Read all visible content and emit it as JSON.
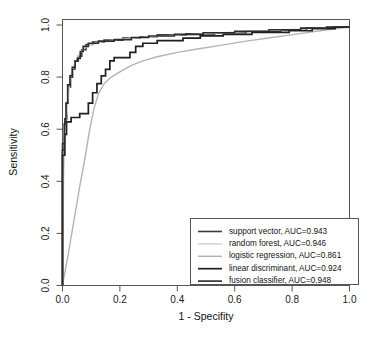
{
  "chart_data": {
    "type": "line",
    "title": "",
    "xlabel": "1 - Specifity",
    "ylabel": "Sensitivity",
    "xlim": [
      0,
      1
    ],
    "ylim": [
      0,
      1
    ],
    "grid": false,
    "legend_position": "bottom-right",
    "xticks": [
      "0.0",
      "0.2",
      "0.4",
      "0.6",
      "0.8",
      "1.0"
    ],
    "xtick_values": [
      0.0,
      0.2,
      0.4,
      0.6,
      0.8,
      1.0
    ],
    "yticks": [
      "0.0",
      "0.2",
      "0.4",
      "0.6",
      "0.8",
      "1.0"
    ],
    "ytick_values": [
      0.0,
      0.2,
      0.4,
      0.6,
      0.8,
      1.0
    ],
    "series": [
      {
        "name": "support vector",
        "auc": 0.943,
        "legend_label": "support vector,  AUC=0.943",
        "color": "#3a3a3a",
        "width": 1.6,
        "points": [
          [
            0.0,
            0.0
          ],
          [
            0.0,
            0.545
          ],
          [
            0.008,
            0.545
          ],
          [
            0.008,
            0.64
          ],
          [
            0.016,
            0.64
          ],
          [
            0.016,
            0.7
          ],
          [
            0.02,
            0.7
          ],
          [
            0.02,
            0.762
          ],
          [
            0.028,
            0.762
          ],
          [
            0.028,
            0.8
          ],
          [
            0.035,
            0.8
          ],
          [
            0.035,
            0.83
          ],
          [
            0.043,
            0.83
          ],
          [
            0.043,
            0.862
          ],
          [
            0.055,
            0.862
          ],
          [
            0.055,
            0.88
          ],
          [
            0.067,
            0.88
          ],
          [
            0.067,
            0.905
          ],
          [
            0.082,
            0.905
          ],
          [
            0.082,
            0.925
          ],
          [
            0.105,
            0.925
          ],
          [
            0.105,
            0.935
          ],
          [
            0.145,
            0.935
          ],
          [
            0.145,
            0.942
          ],
          [
            0.21,
            0.942
          ],
          [
            0.21,
            0.95
          ],
          [
            0.27,
            0.95
          ],
          [
            0.27,
            0.955
          ],
          [
            0.33,
            0.955
          ],
          [
            0.33,
            0.962
          ],
          [
            0.43,
            0.962
          ],
          [
            0.43,
            0.966
          ],
          [
            0.53,
            0.966
          ],
          [
            0.53,
            0.97
          ],
          [
            0.64,
            0.97
          ],
          [
            0.64,
            0.975
          ],
          [
            0.76,
            0.975
          ],
          [
            0.76,
            0.98
          ],
          [
            0.85,
            0.98
          ],
          [
            0.85,
            0.988
          ],
          [
            0.94,
            0.988
          ],
          [
            0.94,
            0.992
          ],
          [
            1.0,
            0.992
          ]
        ]
      },
      {
        "name": "random forest",
        "auc": 0.946,
        "legend_label": "random forest,  AUC=0.946",
        "color": "#d2d2d2",
        "width": 1.4,
        "points": [
          [
            0.0,
            0.0
          ],
          [
            0.004,
            0.43
          ],
          [
            0.008,
            0.52
          ],
          [
            0.012,
            0.6
          ],
          [
            0.016,
            0.66
          ],
          [
            0.02,
            0.72
          ],
          [
            0.024,
            0.775
          ],
          [
            0.03,
            0.812
          ],
          [
            0.038,
            0.84
          ],
          [
            0.046,
            0.862
          ],
          [
            0.056,
            0.882
          ],
          [
            0.068,
            0.902
          ],
          [
            0.084,
            0.918
          ],
          [
            0.105,
            0.928
          ],
          [
            0.14,
            0.936
          ],
          [
            0.19,
            0.944
          ],
          [
            0.25,
            0.95
          ],
          [
            0.32,
            0.956
          ],
          [
            0.41,
            0.962
          ],
          [
            0.51,
            0.968
          ],
          [
            0.62,
            0.974
          ],
          [
            0.73,
            0.98
          ],
          [
            0.84,
            0.985
          ],
          [
            0.93,
            0.99
          ],
          [
            1.0,
            0.992
          ]
        ]
      },
      {
        "name": "logistic regression",
        "auc": 0.861,
        "legend_label": "logistic regression,  AUC=0.861",
        "color": "#b4b4b4",
        "width": 1.4,
        "points": [
          [
            0.0,
            0.0
          ],
          [
            0.02,
            0.12
          ],
          [
            0.04,
            0.25
          ],
          [
            0.06,
            0.38
          ],
          [
            0.08,
            0.5
          ],
          [
            0.095,
            0.6
          ],
          [
            0.11,
            0.68
          ],
          [
            0.125,
            0.735
          ],
          [
            0.145,
            0.775
          ],
          [
            0.17,
            0.8
          ],
          [
            0.2,
            0.82
          ],
          [
            0.24,
            0.845
          ],
          [
            0.28,
            0.862
          ],
          [
            0.33,
            0.878
          ],
          [
            0.4,
            0.895
          ],
          [
            0.47,
            0.908
          ],
          [
            0.55,
            0.922
          ],
          [
            0.64,
            0.938
          ],
          [
            0.73,
            0.952
          ],
          [
            0.82,
            0.966
          ],
          [
            0.91,
            0.98
          ],
          [
            1.0,
            0.992
          ]
        ]
      },
      {
        "name": "linear discriminant",
        "auc": 0.924,
        "legend_label": "linear discriminant,  AUC=0.924",
        "color": "#1f1f1f",
        "width": 1.7,
        "points": [
          [
            0.0,
            0.0
          ],
          [
            0.0,
            0.5
          ],
          [
            0.008,
            0.5
          ],
          [
            0.008,
            0.58
          ],
          [
            0.014,
            0.58
          ],
          [
            0.014,
            0.628
          ],
          [
            0.03,
            0.628
          ],
          [
            0.03,
            0.645
          ],
          [
            0.06,
            0.645
          ],
          [
            0.06,
            0.66
          ],
          [
            0.09,
            0.66
          ],
          [
            0.09,
            0.7
          ],
          [
            0.105,
            0.7
          ],
          [
            0.105,
            0.74
          ],
          [
            0.12,
            0.74
          ],
          [
            0.12,
            0.775
          ],
          [
            0.135,
            0.775
          ],
          [
            0.135,
            0.805
          ],
          [
            0.15,
            0.805
          ],
          [
            0.15,
            0.83
          ],
          [
            0.165,
            0.83
          ],
          [
            0.165,
            0.862
          ],
          [
            0.18,
            0.862
          ],
          [
            0.18,
            0.875
          ],
          [
            0.235,
            0.875
          ],
          [
            0.235,
            0.895
          ],
          [
            0.255,
            0.895
          ],
          [
            0.255,
            0.918
          ],
          [
            0.28,
            0.918
          ],
          [
            0.28,
            0.93
          ],
          [
            0.33,
            0.93
          ],
          [
            0.33,
            0.94
          ],
          [
            0.42,
            0.94
          ],
          [
            0.42,
            0.95
          ],
          [
            0.48,
            0.95
          ],
          [
            0.48,
            0.958
          ],
          [
            0.56,
            0.958
          ],
          [
            0.56,
            0.964
          ],
          [
            0.66,
            0.964
          ],
          [
            0.66,
            0.972
          ],
          [
            0.79,
            0.972
          ],
          [
            0.79,
            0.978
          ],
          [
            0.87,
            0.978
          ],
          [
            0.87,
            0.986
          ],
          [
            0.95,
            0.986
          ],
          [
            0.95,
            0.992
          ],
          [
            1.0,
            0.992
          ]
        ]
      },
      {
        "name": "fusion classifier",
        "auc": 0.948,
        "legend_label": "fusion classifier,  AUC=0.948",
        "color": "#2b2b2b",
        "width": 1.6,
        "points": [
          [
            0.0,
            0.0
          ],
          [
            0.0,
            0.52
          ],
          [
            0.006,
            0.52
          ],
          [
            0.006,
            0.62
          ],
          [
            0.012,
            0.62
          ],
          [
            0.012,
            0.7
          ],
          [
            0.018,
            0.7
          ],
          [
            0.018,
            0.77
          ],
          [
            0.026,
            0.77
          ],
          [
            0.026,
            0.805
          ],
          [
            0.034,
            0.805
          ],
          [
            0.034,
            0.838
          ],
          [
            0.044,
            0.838
          ],
          [
            0.044,
            0.862
          ],
          [
            0.052,
            0.862
          ],
          [
            0.052,
            0.872
          ],
          [
            0.062,
            0.872
          ],
          [
            0.062,
            0.898
          ],
          [
            0.072,
            0.898
          ],
          [
            0.072,
            0.918
          ],
          [
            0.09,
            0.918
          ],
          [
            0.09,
            0.93
          ],
          [
            0.125,
            0.93
          ],
          [
            0.125,
            0.938
          ],
          [
            0.18,
            0.938
          ],
          [
            0.18,
            0.944
          ],
          [
            0.24,
            0.944
          ],
          [
            0.24,
            0.952
          ],
          [
            0.3,
            0.952
          ],
          [
            0.3,
            0.958
          ],
          [
            0.39,
            0.958
          ],
          [
            0.39,
            0.964
          ],
          [
            0.49,
            0.964
          ],
          [
            0.49,
            0.97
          ],
          [
            0.6,
            0.97
          ],
          [
            0.6,
            0.976
          ],
          [
            0.72,
            0.976
          ],
          [
            0.72,
            0.982
          ],
          [
            0.83,
            0.982
          ],
          [
            0.83,
            0.988
          ],
          [
            0.92,
            0.988
          ],
          [
            0.92,
            0.992
          ],
          [
            1.0,
            0.992
          ]
        ]
      }
    ]
  }
}
